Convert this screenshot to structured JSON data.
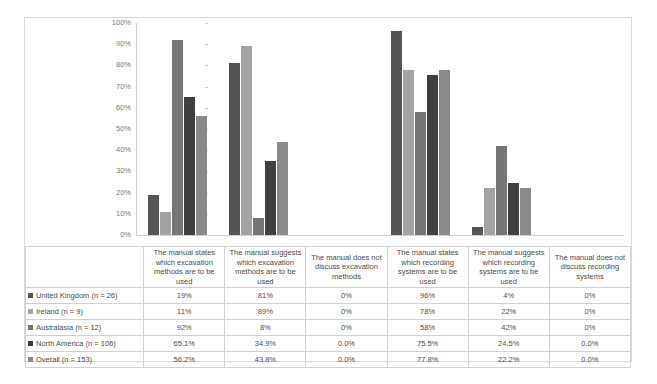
{
  "chart_data": {
    "type": "bar",
    "title": "",
    "xlabel": "",
    "ylabel": "",
    "ylim": [
      0,
      100
    ],
    "grid": false,
    "legend_position": "table-row-headers",
    "ytick_labels": [
      "100%",
      "90%",
      "80%",
      "70%",
      "60%",
      "50%",
      "40%",
      "30%",
      "20%",
      "10%",
      "0%"
    ],
    "ytick_values": [
      100,
      90,
      80,
      70,
      60,
      50,
      40,
      30,
      20,
      10,
      0
    ],
    "categories": [
      "The manual states which excavation methods are to be used",
      "The manual suggests which excavation methods are to be used",
      "The manual does not discuss excavation methods",
      "The manual states which recording systems are to be used",
      "The manual suggests which recording systems are to be used",
      "The manual does not discuss recording systems"
    ],
    "series": [
      {
        "name": "United Kingdom (n = 26)",
        "color": "#545454",
        "values": [
          19,
          81,
          0,
          96,
          4,
          0
        ],
        "labels": [
          "19%",
          "81%",
          "0%",
          "96%",
          "4%",
          "0%"
        ]
      },
      {
        "name": "Ireland (n = 9)",
        "color": "#a3a3a3",
        "values": [
          11,
          89,
          0,
          78,
          22,
          0
        ],
        "labels": [
          "11%",
          "89%",
          "0%",
          "78%",
          "22%",
          "0%"
        ]
      },
      {
        "name": "Australasia (n = 12)",
        "color": "#767676",
        "values": [
          92,
          8,
          0,
          58,
          42,
          0
        ],
        "labels": [
          "92%",
          "8%",
          "0%",
          "58%",
          "42%",
          "0%"
        ]
      },
      {
        "name": "North America (n = 106)",
        "color": "#3f3f3f",
        "values": [
          65.1,
          34.9,
          0.0,
          75.5,
          24.5,
          0.0
        ],
        "labels": [
          "65.1%",
          "34.9%",
          "0.0%",
          "75.5%",
          "24.5%",
          "0.0%"
        ]
      },
      {
        "name": "Overall (n = 153)",
        "color": "#8a8a8a",
        "values": [
          56.2,
          43.8,
          0.0,
          77.8,
          22.2,
          0.0
        ],
        "labels": [
          "56.2%",
          "43.8%",
          "0.0%",
          "77.8%",
          "22.2%",
          "0.0%"
        ]
      }
    ]
  }
}
